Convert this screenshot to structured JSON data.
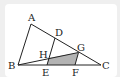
{
  "figure": {
    "points": {
      "A": {
        "label": "A"
      },
      "B": {
        "label": "B"
      },
      "C": {
        "label": "C"
      },
      "D": {
        "label": "D"
      },
      "E": {
        "label": "E"
      },
      "F": {
        "label": "F"
      },
      "G": {
        "label": "G"
      },
      "H": {
        "label": "H"
      }
    },
    "segments": [
      "AB",
      "AC",
      "BC",
      "BG",
      "DE",
      "GF"
    ],
    "shaded_region": [
      "H",
      "E",
      "F",
      "G"
    ],
    "colors": {
      "stroke": "#222222",
      "shade": "#b3b3b3",
      "background": "#efefef",
      "card": "#ffffff"
    }
  }
}
